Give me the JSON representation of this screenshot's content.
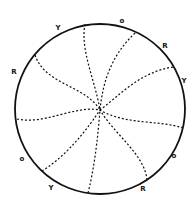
{
  "diagram": {
    "circle": {
      "cx": 100,
      "cy": 109,
      "r": 85,
      "stroke": "#111111"
    },
    "center": {
      "x": 100,
      "y": 110
    },
    "spirals": [
      {
        "d": "M85,24 C80,50 95,80 100,110"
      },
      {
        "d": "M135,33 C112,55 103,80 100,110"
      },
      {
        "d": "M173,67 C140,72 120,95 100,110"
      },
      {
        "d": "M183,128 C160,120 125,125 100,110"
      },
      {
        "d": "M147,180 C145,155 115,135 100,110"
      },
      {
        "d": "M88,193 C95,165 98,135 100,110"
      },
      {
        "d": "M42,171 C60,160 80,140 100,110"
      },
      {
        "d": "M17,119 C45,125 75,105 100,110"
      },
      {
        "d": "M35,55 C45,85 85,85 100,110"
      }
    ],
    "labels": [
      {
        "text": "Y",
        "x": 58,
        "y": 30
      },
      {
        "text": "o",
        "x": 122,
        "y": 23
      },
      {
        "text": "R",
        "x": 165,
        "y": 48
      },
      {
        "text": "Y",
        "x": 184,
        "y": 83
      },
      {
        "text": "R",
        "x": 14,
        "y": 74
      },
      {
        "text": "o",
        "x": 22,
        "y": 161
      },
      {
        "text": "o",
        "x": 174,
        "y": 158
      },
      {
        "text": "Y",
        "x": 51,
        "y": 190
      },
      {
        "text": "R",
        "x": 143,
        "y": 191
      }
    ]
  }
}
